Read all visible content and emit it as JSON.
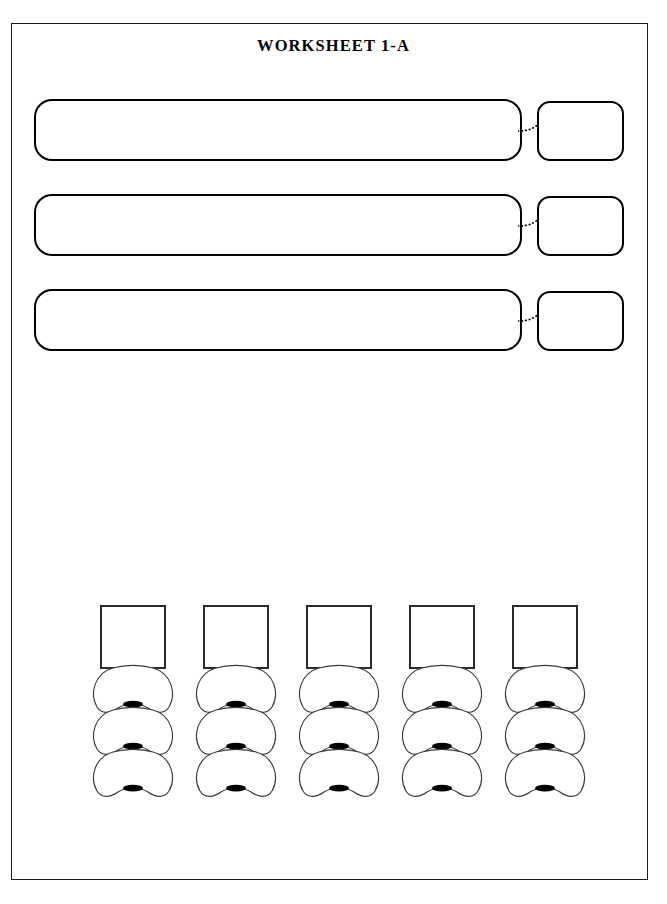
{
  "page": {
    "title": "WORKSHEET 1-A",
    "background_color": "#ffffff",
    "border_color": "#1a1a1a",
    "ink_color": "#000000",
    "width": 667,
    "height": 904
  },
  "prompt_rows": [
    {
      "index": 1,
      "question_text": "",
      "answer_text": "",
      "connector": "dotted-curve",
      "marker": "filled-dot",
      "top": 99
    },
    {
      "index": 2,
      "question_text": "",
      "answer_text": "",
      "connector": "dotted-curve",
      "marker": "filled-dot",
      "top": 194
    },
    {
      "index": 3,
      "question_text": "",
      "answer_text": "",
      "connector": "dotted-curve",
      "marker": "filled-dot",
      "top": 289
    }
  ],
  "seat_grid": {
    "columns": [
      {
        "index": 1,
        "label": "",
        "left": 91,
        "seats": [
          "",
          "",
          ""
        ]
      },
      {
        "index": 2,
        "label": "",
        "left": 194,
        "seats": [
          "",
          "",
          ""
        ]
      },
      {
        "index": 3,
        "label": "",
        "left": 297,
        "seats": [
          "",
          "",
          ""
        ]
      },
      {
        "index": 4,
        "label": "",
        "left": 400,
        "seats": [
          "",
          "",
          ""
        ]
      },
      {
        "index": 5,
        "label": "",
        "left": 503,
        "seats": [
          "",
          "",
          ""
        ]
      }
    ]
  },
  "icons": {
    "seat_shape": "seat-top-view-icon",
    "seat_marker": "seat-marker-icon",
    "connector": "dotted-connector-icon",
    "answer_marker": "answer-dot-icon"
  }
}
